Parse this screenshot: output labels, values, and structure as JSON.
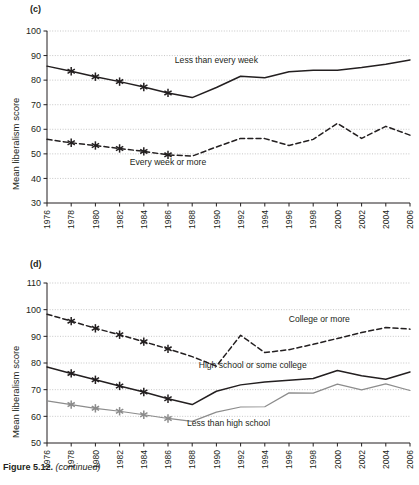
{
  "figure": {
    "caption_bold": "Figure 5.12.",
    "caption_rest": " (continued)"
  },
  "panels": [
    {
      "letter": "(c)",
      "ylabel": "Mean liberalism score"
    },
    {
      "letter": "(d)",
      "ylabel": "Mean liberalism score"
    }
  ],
  "chart_data": [
    {
      "type": "line",
      "panel": "(c)",
      "title": "",
      "xlabel": "",
      "ylabel": "Mean liberalism score",
      "ylim": [
        30,
        100
      ],
      "yticks": [
        30,
        40,
        50,
        60,
        70,
        80,
        90,
        100
      ],
      "xlim": [
        1976,
        2006
      ],
      "xticks": [
        1976,
        1978,
        1980,
        1982,
        1984,
        1986,
        1988,
        1990,
        1992,
        1994,
        1996,
        1998,
        2000,
        2002,
        2004,
        2006
      ],
      "x": [
        1976,
        1977,
        1978,
        1980,
        1982,
        1984,
        1986,
        1988,
        1990,
        1991,
        1993,
        1994,
        1996,
        1998,
        2000,
        2002,
        2004,
        2006
      ],
      "grid": true,
      "legend_position": "inline-annotations",
      "series": [
        {
          "name": "Less than every week",
          "style": "solid",
          "color": "#231f20",
          "marker": "asterisk-through-1986",
          "label_x": 1990.0,
          "label_y": 87.0,
          "x": [
            1976,
            1978,
            1980,
            1982,
            1984,
            1986,
            1988,
            1990,
            1992,
            1994,
            1996,
            1998,
            2000,
            2002,
            2004,
            2006
          ],
          "values": [
            85.7,
            83.6,
            81.4,
            79.4,
            77.2,
            74.8,
            72.9,
            77.0,
            81.6,
            81.0,
            83.4,
            84.0,
            84.0,
            85.1,
            86.5,
            88.2
          ],
          "marker_x": [
            1978,
            1980,
            1982,
            1984,
            1986
          ],
          "marker_y": [
            83.6,
            81.4,
            79.4,
            77.2,
            74.8
          ]
        },
        {
          "name": "Every week or more",
          "style": "dashed",
          "color": "#231f20",
          "marker": "asterisk-through-1986",
          "label_x": 1986.0,
          "label_y": 45.5,
          "x": [
            1976,
            1978,
            1980,
            1982,
            1984,
            1986,
            1988,
            1990,
            1992,
            1994,
            1996,
            1998,
            2000,
            2002,
            2004,
            2006
          ],
          "values": [
            55.9,
            54.5,
            53.4,
            52.2,
            51.0,
            49.6,
            49.1,
            52.8,
            56.3,
            56.2,
            53.4,
            55.9,
            62.4,
            56.3,
            61.2,
            57.6
          ],
          "marker_x": [
            1978,
            1980,
            1982,
            1984,
            1986
          ],
          "marker_y": [
            54.5,
            53.4,
            52.2,
            51.0,
            49.6
          ]
        }
      ]
    },
    {
      "type": "line",
      "panel": "(d)",
      "title": "",
      "xlabel": "",
      "ylabel": "Mean liberalism score",
      "ylim": [
        50,
        110
      ],
      "yticks": [
        50,
        60,
        70,
        80,
        90,
        100,
        110
      ],
      "xlim": [
        1976,
        2006
      ],
      "xticks": [
        1976,
        1978,
        1980,
        1982,
        1984,
        1986,
        1988,
        1990,
        1992,
        1994,
        1996,
        1998,
        2000,
        2002,
        2004,
        2006
      ],
      "grid": true,
      "legend_position": "inline-annotations",
      "series": [
        {
          "name": "College or more",
          "style": "dashed",
          "color": "#231f20",
          "marker": "asterisk-through-1986",
          "label_x": 1998.5,
          "label_y": 95.5,
          "x": [
            1976,
            1978,
            1980,
            1982,
            1984,
            1986,
            1988,
            1990,
            1992,
            1994,
            1996,
            1998,
            2000,
            2002,
            2004,
            2006
          ],
          "values": [
            98.3,
            95.7,
            93.0,
            90.6,
            88.0,
            85.3,
            82.4,
            78.8,
            90.4,
            83.9,
            85.0,
            87.0,
            89.2,
            91.4,
            93.3,
            92.7
          ],
          "marker_x": [
            1978,
            1980,
            1982,
            1984,
            1986
          ],
          "marker_y": [
            95.7,
            93.0,
            90.6,
            88.0,
            85.3
          ]
        },
        {
          "name": "High school or some college",
          "style": "solid",
          "color": "#231f20",
          "marker": "asterisk-through-1986",
          "label_x": 1993.0,
          "label_y": 78.2,
          "x": [
            1976,
            1978,
            1980,
            1982,
            1984,
            1986,
            1988,
            1990,
            1992,
            1994,
            1996,
            1998,
            2000,
            2002,
            2004,
            2006
          ],
          "values": [
            78.5,
            76.1,
            73.7,
            71.4,
            69.1,
            66.6,
            64.4,
            69.4,
            71.8,
            72.9,
            73.5,
            74.2,
            77.2,
            75.2,
            73.9,
            76.6
          ],
          "marker_x": [
            1978,
            1980,
            1982,
            1984,
            1986
          ],
          "marker_y": [
            76.1,
            73.7,
            71.4,
            69.1,
            66.6
          ]
        },
        {
          "name": "Less than high school",
          "style": "solid",
          "color": "#8c8c8c",
          "marker": "asterisk-through-1986",
          "label_x": 1991.0,
          "label_y": 56.5,
          "x": [
            1976,
            1978,
            1980,
            1982,
            1984,
            1986,
            1988,
            1990,
            1992,
            1994,
            1996,
            1998,
            2000,
            2002,
            2004,
            2006
          ],
          "values": [
            65.8,
            64.4,
            63.0,
            61.9,
            60.6,
            59.2,
            58.1,
            61.6,
            63.5,
            63.6,
            68.8,
            68.7,
            72.1,
            69.9,
            72.2,
            69.7
          ],
          "marker_x": [
            1978,
            1980,
            1982,
            1984,
            1986
          ],
          "marker_y": [
            64.4,
            63.0,
            61.9,
            60.6,
            59.2
          ]
        }
      ]
    }
  ]
}
